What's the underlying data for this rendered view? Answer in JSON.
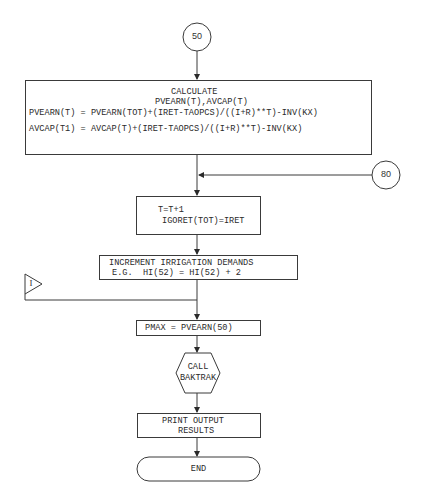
{
  "connectors": {
    "entry": {
      "label": "50"
    },
    "loop_return": {
      "label": "80"
    },
    "offpage_in": {
      "label": "I"
    }
  },
  "calculate_box": {
    "title": "CALCULATE",
    "subtitle": "PVEARN(T),AVCAP(T)",
    "line1": "PVEARN(T) = PVEARN(TOT)+(IRET-TAOPCS)/((I+R)**T)-INV(KX)",
    "line2": "AVCAP(T1) = AVCAP(T)+(IRET-TAOPCS)/((I+R)**T)-INV(KX)"
  },
  "increment_t_box": {
    "line1": "T=T+1",
    "line2": "IGORET(TOT)=IRET"
  },
  "irrigation_box": {
    "line1": "INCREMENT IRRIGATION DEMANDS",
    "line2": "E.G.  HI(52) = HI(52) + 2"
  },
  "pmax_box": {
    "line1": "PMAX = PVEARN(50)"
  },
  "call_box": {
    "line1": "CALL",
    "line2": "BAKTRAK"
  },
  "print_box": {
    "line1": "PRINT OUTPUT",
    "line2": "RESULTS"
  },
  "end_box": {
    "label": "END"
  },
  "colors": {
    "ink": "#3a3a3a",
    "paper": "#ffffff"
  }
}
